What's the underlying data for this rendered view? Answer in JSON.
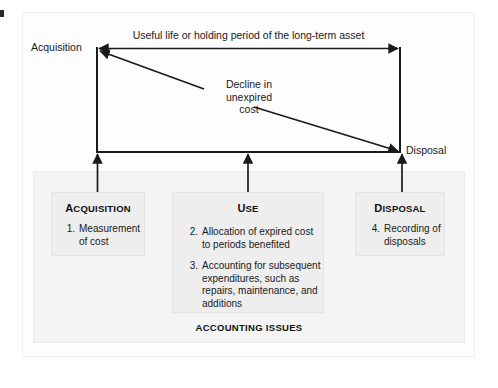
{
  "figure": {
    "timeline_caption": "Useful life or holding period of the long-term asset",
    "acquisition_point_label": "Acquisition",
    "disposal_point_label": "Disposal",
    "decline_label_line1": "Decline in",
    "decline_label_line2": "unexpired",
    "decline_label_line3": "cost",
    "issues_caption": "ACCOUNTING ISSUES"
  },
  "boxes": [
    {
      "id": "acquisition",
      "title_cap": "A",
      "title_rest": "CQUISITION",
      "items": [
        {
          "num": "1.",
          "text": "Measurement of cost"
        }
      ]
    },
    {
      "id": "use",
      "title_cap": "U",
      "title_rest": "SE",
      "items": [
        {
          "num": "2.",
          "text": "Allocation of expired cost to periods benefited"
        },
        {
          "num": "3.",
          "text": "Accounting for subsequent expenditures, such as repairs, maintenance, and additions"
        }
      ]
    },
    {
      "id": "disposal",
      "title_cap": "D",
      "title_rest": "ISPOSAL",
      "items": [
        {
          "num": "4.",
          "text": "Recording of disposals"
        }
      ]
    }
  ],
  "colors": {
    "ink": "#1a1a1a",
    "panel_bg": "#fdfdfd",
    "issues_bg": "#f4f4f4",
    "box_bg": "#eeeeee"
  }
}
